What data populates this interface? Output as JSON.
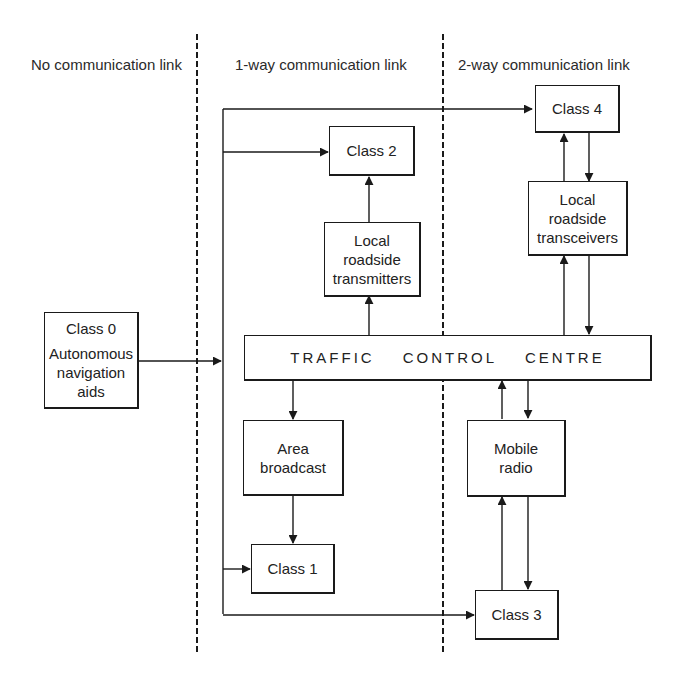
{
  "diagram": {
    "type": "block-diagram",
    "zones": [
      {
        "id": "no-link",
        "label": "No communication link"
      },
      {
        "id": "one-way",
        "label": "1-way communication link"
      },
      {
        "id": "two-way",
        "label": "2-way communication link"
      }
    ],
    "boxes": {
      "class0": {
        "title": "Class 0",
        "lines": [
          "Autonomous",
          "navigation",
          "aids"
        ]
      },
      "class1": {
        "lines": [
          "Class 1"
        ]
      },
      "class2": {
        "lines": [
          "Class 2"
        ]
      },
      "class3": {
        "lines": [
          "Class 3"
        ]
      },
      "class4": {
        "lines": [
          "Class 4"
        ]
      },
      "transmitters": {
        "lines": [
          "Local",
          "roadside",
          "transmitters"
        ]
      },
      "transceivers": {
        "lines": [
          "Local",
          "roadside",
          "transceivers"
        ]
      },
      "area_broadcast": {
        "lines": [
          "Area",
          "broadcast"
        ]
      },
      "mobile_radio": {
        "lines": [
          "Mobile",
          "radio"
        ]
      },
      "tcc": {
        "words": [
          "TRAFFIC",
          "CONTROL",
          "CENTRE"
        ]
      }
    },
    "edges": [
      {
        "from": "Class 0",
        "to": "vertical bus",
        "direction": "one-way"
      },
      {
        "from": "vertical bus",
        "to": "Class 4",
        "direction": "one-way"
      },
      {
        "from": "vertical bus",
        "to": "Class 2",
        "direction": "one-way"
      },
      {
        "from": "vertical bus",
        "to": "Class 1",
        "direction": "one-way"
      },
      {
        "from": "vertical bus",
        "to": "Class 3",
        "direction": "one-way"
      },
      {
        "from": "Traffic Control Centre",
        "to": "Local roadside transmitters",
        "direction": "one-way"
      },
      {
        "from": "Local roadside transmitters",
        "to": "Class 2",
        "direction": "one-way"
      },
      {
        "from": "Traffic Control Centre",
        "to": "Area broadcast",
        "direction": "one-way"
      },
      {
        "from": "Area broadcast",
        "to": "Class 1",
        "direction": "one-way"
      },
      {
        "from": "Traffic Control Centre",
        "to": "Local roadside transceivers",
        "direction": "two-way"
      },
      {
        "from": "Local roadside transceivers",
        "to": "Class 4",
        "direction": "two-way"
      },
      {
        "from": "Traffic Control Centre",
        "to": "Mobile radio",
        "direction": "two-way"
      },
      {
        "from": "Mobile radio",
        "to": "Class 3",
        "direction": "two-way"
      }
    ]
  }
}
